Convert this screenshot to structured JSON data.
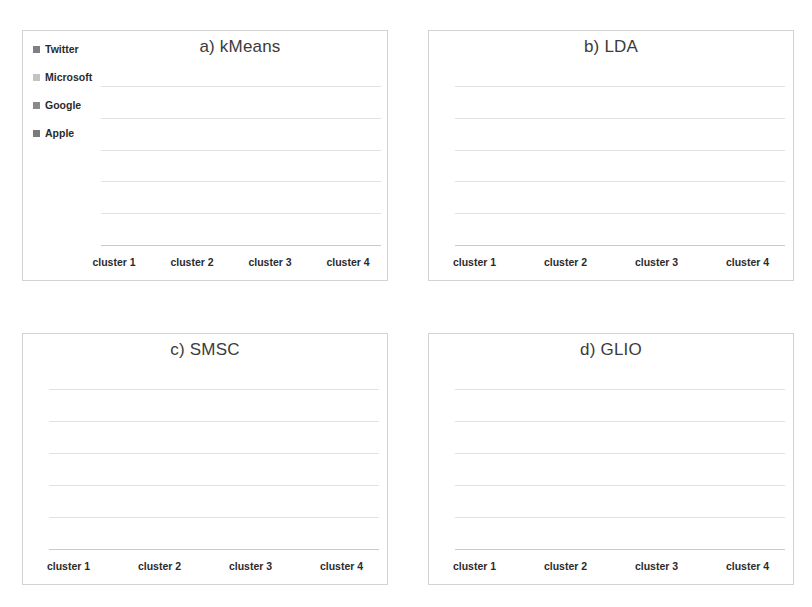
{
  "figure": {
    "background": "#ffffff",
    "panel_border": "#d2d2d2",
    "gridline_color": "#dfe3e6",
    "axis_color": "#c9c9c9"
  },
  "legend": {
    "items": [
      {
        "label": "Twitter",
        "color": "#808080"
      },
      {
        "label": "Microsoft",
        "color": "#c3c3c3"
      },
      {
        "label": "Google",
        "color": "#8a8a8a"
      },
      {
        "label": "Apple",
        "color": "#7b7b7b"
      }
    ]
  },
  "series_colors": {
    "Apple": "#7b7b7b",
    "Google": "#8a8a8a",
    "Microsoft": "#c3c3c3",
    "Twitter": "#6f6f6f"
  },
  "categories": [
    "cluster 1",
    "cluster 2",
    "cluster 3",
    "cluster 4"
  ],
  "panels": [
    {
      "id": "kmeans",
      "title": "a) kMeans",
      "has_legend": true
    },
    {
      "id": "lda",
      "title": "b) LDA",
      "has_legend": false
    },
    {
      "id": "smsc",
      "title": "c) SMSC",
      "has_legend": false
    },
    {
      "id": "glio",
      "title": "d) GLIO",
      "has_legend": false
    }
  ],
  "chart_data": [
    {
      "type": "bar",
      "title": "a) kMeans",
      "stacked": true,
      "xlabel": "",
      "ylabel": "",
      "ylim": [
        0,
        100
      ],
      "grid": true,
      "legend_position": "top-left",
      "categories": [
        "cluster 1",
        "cluster 2",
        "cluster 3",
        "cluster 4"
      ],
      "series": [
        {
          "name": "Apple",
          "color": "#7b7b7b",
          "values": [
            1,
            48,
            4,
            18
          ]
        },
        {
          "name": "Google",
          "color": "#8a8a8a",
          "values": [
            0,
            0,
            0,
            0
          ]
        },
        {
          "name": "Microsoft",
          "color": "#c3c3c3",
          "values": [
            0,
            17,
            5,
            9
          ]
        },
        {
          "name": "Twitter",
          "color": "#6f6f6f",
          "values": [
            0,
            27,
            0,
            0
          ]
        }
      ]
    },
    {
      "type": "bar",
      "title": "b) LDA",
      "stacked": true,
      "xlabel": "",
      "ylabel": "",
      "ylim": [
        0,
        100
      ],
      "grid": true,
      "legend_position": "none",
      "categories": [
        "cluster 1",
        "cluster 2",
        "cluster 3",
        "cluster 4"
      ],
      "series": [
        {
          "name": "Apple",
          "color": "#7b7b7b",
          "values": [
            14,
            42,
            34,
            45
          ]
        },
        {
          "name": "Google",
          "color": "#8a8a8a",
          "values": [
            0,
            0,
            0,
            0
          ]
        },
        {
          "name": "Microsoft",
          "color": "#c3c3c3",
          "values": [
            38,
            19,
            20,
            20
          ]
        },
        {
          "name": "Twitter",
          "color": "#6f6f6f",
          "values": [
            38,
            11,
            22,
            6
          ]
        }
      ]
    },
    {
      "type": "bar",
      "title": "c) SMSC",
      "stacked": true,
      "xlabel": "",
      "ylabel": "",
      "ylim": [
        0,
        100
      ],
      "grid": true,
      "legend_position": "none",
      "categories": [
        "cluster 1",
        "cluster 2",
        "cluster 3",
        "cluster 4"
      ],
      "series": [
        {
          "name": "Apple",
          "color": "#7b7b7b",
          "values": [
            47,
            30,
            27,
            0
          ]
        },
        {
          "name": "Google",
          "color": "#8a8a8a",
          "values": [
            0,
            0,
            0,
            0
          ]
        },
        {
          "name": "Microsoft",
          "color": "#c3c3c3",
          "values": [
            20,
            0,
            0,
            23
          ]
        },
        {
          "name": "Twitter",
          "color": "#6f6f6f",
          "values": [
            8,
            0,
            0,
            0
          ]
        }
      ]
    },
    {
      "type": "bar",
      "title": "d) GLIO",
      "stacked": true,
      "xlabel": "",
      "ylabel": "",
      "ylim": [
        0,
        100
      ],
      "grid": true,
      "legend_position": "none",
      "categories": [
        "cluster 1",
        "cluster 2",
        "cluster 3",
        "cluster 4"
      ],
      "series": [
        {
          "name": "Apple",
          "color": "#7b7b7b",
          "values": [
            74,
            0,
            70,
            63
          ]
        },
        {
          "name": "Google",
          "color": "#8a8a8a",
          "values": [
            0,
            0,
            0,
            0
          ]
        },
        {
          "name": "Microsoft",
          "color": "#c3c3c3",
          "values": [
            0,
            76,
            0,
            0
          ]
        },
        {
          "name": "Twitter",
          "color": "#6f6f6f",
          "values": [
            3,
            0,
            0,
            0
          ]
        }
      ]
    }
  ]
}
